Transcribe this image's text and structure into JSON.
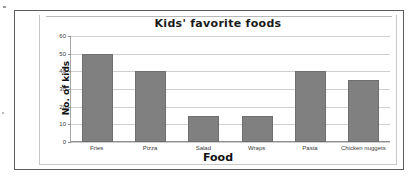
{
  "chart_data": {
    "type": "bar",
    "title": "Kids' favorite foods",
    "xlabel": "Food",
    "ylabel": "No. of kids",
    "categories": [
      "Fries",
      "Pizza",
      "Salad",
      "Wraps",
      "Pasta",
      "Chicken nuggets"
    ],
    "values": [
      50,
      40,
      15,
      15,
      40,
      35
    ],
    "ylim": [
      0,
      60
    ],
    "yticks": [
      0,
      10,
      20,
      30,
      40,
      50,
      60
    ],
    "ytick_labels": [
      "0",
      "10",
      "20",
      "30",
      "40",
      "50",
      "60"
    ],
    "grid": true,
    "legend": false,
    "legend_position": "none",
    "bar_color": "#808080",
    "bar_border_color": "#6e6e6e",
    "gridline_color": "#cfcfcf",
    "axis_color": "#8e8e8e",
    "plot_background": "#ffffff"
  }
}
